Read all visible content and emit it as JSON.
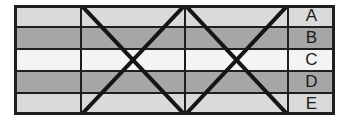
{
  "figure": {
    "frame": {
      "stroke_color": "#1f1f1f",
      "stroke_width": 3,
      "x": 0,
      "y": 0,
      "width": 321,
      "height": 110
    },
    "grid": {
      "inner_stroke_color": "#1f1f1f",
      "inner_stroke_width": 2,
      "diagonal_stroke_color": "#151515",
      "diagonal_stroke_width": 4,
      "vertical_line_x": [
        67,
        171,
        274
      ],
      "horizontal_line_y": [
        22,
        44,
        66,
        88
      ],
      "label_column_x": 274,
      "plot_right_x": 274
    },
    "bands": [
      {
        "id": "A",
        "label": "A",
        "color": "#dadada",
        "y_top": 0,
        "y_bottom": 22
      },
      {
        "id": "B",
        "label": "B",
        "color": "#a6a6a6",
        "y_top": 22,
        "y_bottom": 44
      },
      {
        "id": "C",
        "label": "C",
        "color": "#f4f4f4",
        "y_top": 44,
        "y_bottom": 66
      },
      {
        "id": "D",
        "label": "D",
        "color": "#a6a6a6",
        "y_top": 66,
        "y_bottom": 88
      },
      {
        "id": "E",
        "label": "E",
        "color": "#dadada",
        "y_top": 88,
        "y_bottom": 110
      }
    ],
    "diagonals": [
      {
        "name": "left-panel-down",
        "x1": 67,
        "y1": 0,
        "x2": 171,
        "y2": 110
      },
      {
        "name": "left-panel-up",
        "x1": 67,
        "y1": 110,
        "x2": 171,
        "y2": 0
      },
      {
        "name": "right-panel-down",
        "x1": 171,
        "y1": 0,
        "x2": 274,
        "y2": 110
      },
      {
        "name": "right-panel-up",
        "x1": 171,
        "y1": 110,
        "x2": 274,
        "y2": 0
      }
    ]
  }
}
